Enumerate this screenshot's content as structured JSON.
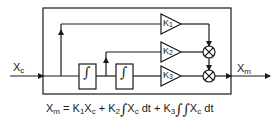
{
  "diagram": {
    "type": "block-diagram",
    "input": {
      "label": "X",
      "subscript": "c"
    },
    "output": {
      "label": "X",
      "subscript": "m"
    },
    "blocks": [
      {
        "id": "int1",
        "kind": "integrator",
        "symbol": "∫"
      },
      {
        "id": "int2",
        "kind": "integrator",
        "symbol": "∫"
      },
      {
        "id": "k1",
        "kind": "gain",
        "label": "K",
        "subscript": "1"
      },
      {
        "id": "k2",
        "kind": "gain",
        "label": "K",
        "subscript": "2"
      },
      {
        "id": "k3",
        "kind": "gain",
        "label": "K",
        "subscript": "3"
      },
      {
        "id": "sum1",
        "kind": "summer",
        "symbol": "⊗"
      },
      {
        "id": "sum2",
        "kind": "summer",
        "symbol": "⊗"
      }
    ],
    "equation": {
      "lhs": "X",
      "lhs_sub": "m",
      "eq": " = ",
      "t1": "K",
      "t1_sub": "1",
      "t1_var": "X",
      "t1_var_sub": "c",
      "plus1": " + ",
      "t2": "K",
      "t2_sub": "2",
      "t2_int": "∫",
      "t2_var": "X",
      "t2_var_sub": "c",
      "t2_dt": " dt",
      "plus2": " + ",
      "t3": "K",
      "t3_sub": "3",
      "t3_int": "∫∫",
      "t3_var": "X",
      "t3_var_sub": "c",
      "t3_dt": " dt"
    },
    "colors": {
      "line": "#1a1a1a",
      "background": "#ffffff"
    }
  }
}
